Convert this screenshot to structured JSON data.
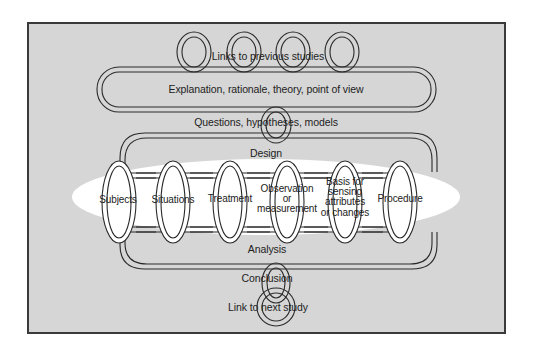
{
  "diagram": {
    "type": "chain-of-research-links",
    "colors": {
      "background": "#d6d6d6",
      "frame_border": "#3a3a3a",
      "highlight_ellipse": "#ffffff",
      "link_stroke": "#2a2a2a",
      "link_fill": "#ffffff"
    },
    "nodes": {
      "links_previous": "Links to previous studies",
      "explanation": "Explanation, rationale, theory, point of view",
      "questions": "Questions, hypotheses, models",
      "design": "Design",
      "subjects": "Subjects",
      "situations": "Situations",
      "treatment": "Treatment",
      "observation_l1": "Observation",
      "observation_l2": "or",
      "observation_l3": "measurement",
      "basis_l1": "Basis for",
      "basis_l2": "sensing",
      "basis_l3": "attributes",
      "basis_l4": "or changes",
      "procedure": "Procedure",
      "analysis": "Analysis",
      "conclusion": "Conclusion",
      "link_next": "Link to next study"
    },
    "edges": [
      [
        "Links to previous studies",
        "Explanation, rationale, theory, point of view"
      ],
      [
        "Explanation, rationale, theory, point of view",
        "Questions, hypotheses, models"
      ],
      [
        "Questions, hypotheses, models",
        "Design"
      ],
      [
        "Design",
        "Subjects"
      ],
      [
        "Design",
        "Procedure"
      ],
      [
        "Subjects",
        "Analysis"
      ],
      [
        "Procedure",
        "Analysis"
      ],
      [
        "Analysis",
        "Conclusion"
      ],
      [
        "Conclusion",
        "Link to next study"
      ]
    ],
    "design_components": [
      "Subjects",
      "Situations",
      "Treatment",
      "Observation or measurement",
      "Basis for sensing attributes or changes",
      "Procedure"
    ]
  }
}
